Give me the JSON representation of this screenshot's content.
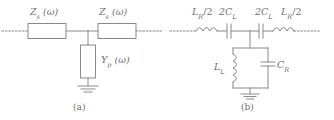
{
  "figure": {
    "stroke_color": "#8a8a8a",
    "text_color": "#6f6f6f",
    "background": "#ffffff"
  },
  "panel_a": {
    "caption": "(a)",
    "series_left": {
      "symbol": "Z",
      "sub": "s",
      "arg": "(ω)",
      "full": "Z_s (ω)"
    },
    "series_right": {
      "symbol": "Z",
      "sub": "s",
      "arg": "(ω)",
      "full": "Z_s (ω)"
    },
    "shunt": {
      "symbol": "Y",
      "sub": "p",
      "arg": "(ω)",
      "full": "Y_p (ω)"
    },
    "ground": "ground-symbol",
    "left_lead": "dotted-lead",
    "right_lead": "dotted-lead"
  },
  "panel_b": {
    "caption": "(b)",
    "series_inductor_left": {
      "prefix": "L",
      "sub": "R",
      "suffix": "/2",
      "full": "L_R/2"
    },
    "series_capacitor_left": {
      "prefix": "2C",
      "sub": "L",
      "suffix": "",
      "full": "2C_L"
    },
    "series_capacitor_right": {
      "prefix": "2C",
      "sub": "L",
      "suffix": "",
      "full": "2C_L"
    },
    "series_inductor_right": {
      "prefix": "L",
      "sub": "R",
      "suffix": "/2",
      "full": "L_R/2"
    },
    "shunt_inductor": {
      "prefix": "L",
      "sub": "L",
      "suffix": "",
      "full": "L_L"
    },
    "shunt_capacitor": {
      "prefix": "C",
      "sub": "R",
      "suffix": "",
      "full": "C_R"
    },
    "ground": "ground-symbol",
    "left_lead": "dotted-lead",
    "right_lead": "dotted-lead"
  }
}
